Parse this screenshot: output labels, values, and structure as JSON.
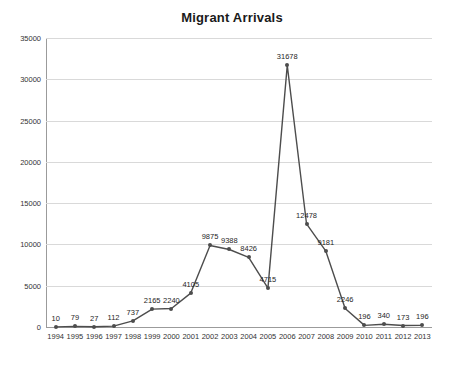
{
  "chart_data": {
    "type": "line",
    "title": "Migrant Arrivals",
    "xlabel": "",
    "ylabel": "",
    "categories": [
      "1994",
      "1995",
      "1996",
      "1997",
      "1998",
      "1999",
      "2000",
      "2001",
      "2002",
      "2003",
      "2004",
      "2005",
      "2006",
      "2007",
      "2008",
      "2009",
      "2010",
      "2011",
      "2012",
      "2013"
    ],
    "values": [
      10,
      79,
      27,
      112,
      737,
      2165,
      2240,
      4105,
      9875,
      9388,
      8426,
      4715,
      31678,
      12478,
      9181,
      2246,
      196,
      340,
      173,
      196
    ],
    "point_labels": [
      "10",
      "79",
      "27",
      "112",
      "737",
      "2165",
      "2240",
      "4105",
      "9875",
      "9388",
      "8426",
      "4715",
      "31678",
      "12478",
      "9181",
      "2246",
      "196",
      "340",
      "173",
      "196"
    ],
    "ylim": [
      0,
      35000
    ],
    "yticks": [
      0,
      5000,
      10000,
      15000,
      20000,
      25000,
      30000,
      35000
    ],
    "ytick_labels": [
      "0",
      "5000",
      "10000",
      "15000",
      "20000",
      "25000",
      "30000",
      "35000"
    ],
    "grid": true,
    "legend": "none",
    "series_color": "#4d4d4d",
    "grid_color": "#d9d9d9",
    "axis_color": "#9b9b9b"
  }
}
